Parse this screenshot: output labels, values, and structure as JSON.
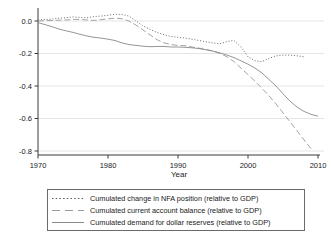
{
  "chart_data": {
    "type": "line",
    "title": "",
    "xlabel": "Year",
    "ylabel": "",
    "xlim": [
      1969,
      2011
    ],
    "ylim": [
      -0.84,
      0.06
    ],
    "grid": true,
    "legend_position": "bottom",
    "x_ticks": [
      1970,
      1980,
      1990,
      2000,
      2010
    ],
    "x_tick_labels": [
      "1970",
      "1980",
      "1990",
      "2000",
      "2010"
    ],
    "y_ticks": [
      "0.0",
      "-0.2",
      "-0.4",
      "-0.6",
      "-0.8"
    ],
    "axis_color": "#3a3a3a",
    "grid_color": "#dedede",
    "series": [
      {
        "name": "Cumulated change in NFA position (relative to GDP)",
        "style": "dotted",
        "color": "#5a5a5a",
        "x": [
          1970,
          1971,
          1972,
          1973,
          1974,
          1975,
          1976,
          1977,
          1978,
          1979,
          1980,
          1981,
          1982,
          1983,
          1984,
          1985,
          1986,
          1987,
          1988,
          1989,
          1990,
          1991,
          1992,
          1993,
          1994,
          1995,
          1996,
          1997,
          1998,
          1999,
          2000,
          2001,
          2002,
          2003,
          2004,
          2005,
          2006,
          2007,
          2008
        ],
        "values": [
          0.005,
          0.01,
          0.012,
          0.018,
          0.02,
          0.025,
          0.022,
          0.02,
          0.027,
          0.03,
          0.035,
          0.042,
          0.04,
          0.03,
          0.0,
          -0.03,
          -0.052,
          -0.07,
          -0.085,
          -0.095,
          -0.1,
          -0.105,
          -0.112,
          -0.12,
          -0.128,
          -0.135,
          -0.14,
          -0.126,
          -0.12,
          -0.16,
          -0.22,
          -0.245,
          -0.25,
          -0.23,
          -0.215,
          -0.21,
          -0.21,
          -0.214,
          -0.22
        ]
      },
      {
        "name": "Cumulated current account balance (relative to GDP)",
        "style": "dashed",
        "color": "#9a9a9a",
        "x": [
          1970,
          1971,
          1972,
          1973,
          1974,
          1975,
          1976,
          1977,
          1978,
          1979,
          1980,
          1981,
          1982,
          1983,
          1984,
          1985,
          1986,
          1987,
          1988,
          1989,
          1990,
          1991,
          1992,
          1993,
          1994,
          1995,
          1996,
          1997,
          1998,
          1999,
          2000,
          2001,
          2002,
          2003,
          2004,
          2005,
          2006,
          2007,
          2008,
          2009
        ],
        "values": [
          0.0,
          0.002,
          0.003,
          0.005,
          0.006,
          0.01,
          0.01,
          0.006,
          0.004,
          0.008,
          0.013,
          0.018,
          0.014,
          0.0,
          -0.025,
          -0.055,
          -0.085,
          -0.115,
          -0.135,
          -0.145,
          -0.15,
          -0.152,
          -0.16,
          -0.167,
          -0.175,
          -0.185,
          -0.2,
          -0.22,
          -0.25,
          -0.29,
          -0.33,
          -0.37,
          -0.415,
          -0.46,
          -0.51,
          -0.565,
          -0.62,
          -0.675,
          -0.732,
          -0.785
        ]
      },
      {
        "name": "Cumulated demand for dollar reserves (relative to GDP)",
        "style": "solid",
        "color": "#8a8a8a",
        "x": [
          1970,
          1971,
          1972,
          1973,
          1974,
          1975,
          1976,
          1977,
          1978,
          1979,
          1980,
          1981,
          1982,
          1983,
          1984,
          1985,
          1986,
          1987,
          1988,
          1989,
          1990,
          1991,
          1992,
          1993,
          1994,
          1995,
          1996,
          1997,
          1998,
          1999,
          2000,
          2001,
          2002,
          2003,
          2004,
          2005,
          2006,
          2007,
          2008,
          2009,
          2010
        ],
        "values": [
          -0.01,
          -0.022,
          -0.035,
          -0.05,
          -0.06,
          -0.07,
          -0.082,
          -0.092,
          -0.1,
          -0.105,
          -0.112,
          -0.12,
          -0.135,
          -0.145,
          -0.15,
          -0.155,
          -0.158,
          -0.157,
          -0.156,
          -0.16,
          -0.16,
          -0.162,
          -0.165,
          -0.17,
          -0.177,
          -0.185,
          -0.196,
          -0.21,
          -0.225,
          -0.245,
          -0.266,
          -0.29,
          -0.32,
          -0.36,
          -0.4,
          -0.448,
          -0.493,
          -0.53,
          -0.556,
          -0.575,
          -0.585
        ]
      }
    ]
  }
}
